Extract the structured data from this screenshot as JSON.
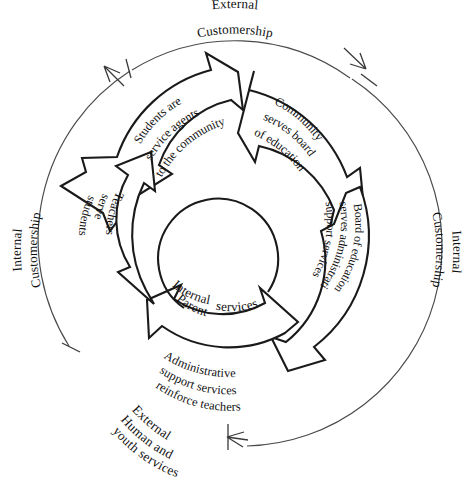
{
  "diagram": {
    "type": "circular-process",
    "background_color": "#ffffff",
    "line_color": "#1a1a1a",
    "ring_line_color": "#4a4a4a",
    "ring_labels": {
      "top_line1": "External",
      "top_line2": "Customership",
      "left_line1": "Internal",
      "left_line2": "Customership",
      "right_line1": "Internal",
      "right_line2": "Customership",
      "bottom_line1": "External",
      "bottom_line2": "Human and",
      "bottom_line3": "youth services"
    },
    "center": {
      "line1": "Internal",
      "line2": "Parent",
      "line3": "services"
    },
    "arrows": [
      {
        "id": "students-community",
        "position": "top-left",
        "lines": [
          "Students are",
          "service agents",
          "to the community"
        ]
      },
      {
        "id": "community-board",
        "position": "top-right",
        "lines": [
          "Community",
          "serves board",
          "of education"
        ]
      },
      {
        "id": "board-admin",
        "position": "right",
        "lines": [
          "Board of education",
          "serves administrative",
          "support services"
        ]
      },
      {
        "id": "admin-teachers",
        "position": "bottom",
        "lines": [
          "Administrative",
          "support services",
          "reinforce teachers"
        ]
      },
      {
        "id": "teachers-students",
        "position": "left",
        "lines": [
          "Teachers",
          "serve",
          "students"
        ]
      }
    ],
    "markers": {
      "top_left_arrowhead": "arrowhead-up-left",
      "top_left_tick": "tick-mark",
      "top_right_arrowhead": "arrowhead-down-right",
      "top_right_tick": "tick-mark",
      "bottom_left_tick": "tick-mark",
      "bottom_right_arrowhead": "arrowhead-left",
      "bottom_right_tick": "tick-mark"
    }
  }
}
